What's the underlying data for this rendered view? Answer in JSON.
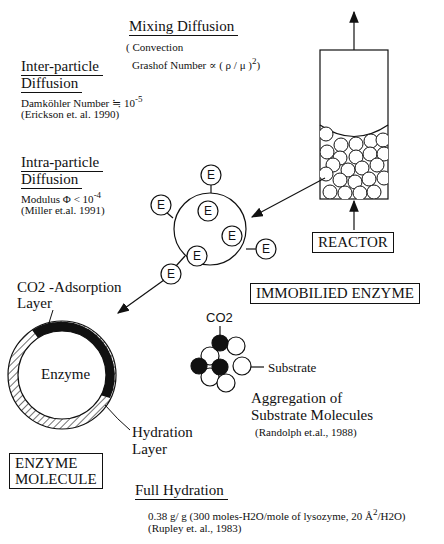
{
  "mixing": {
    "title": "Mixing Diffusion",
    "line1": "( Convection",
    "line2": "Grashof Number  ∝  ( ρ / μ )",
    "exponent": "2",
    "close": ")"
  },
  "inter_particle": {
    "title1": "Inter-particle",
    "title2": "Diffusion",
    "formula": "Damköhler Number  ≒ 10",
    "exponent": "-5",
    "reference": "(Erickson et. al. 1990)"
  },
  "intra_particle": {
    "title1": "Intra-particle",
    "title2": "Diffusion",
    "formula": "Modulus Φ < 10",
    "exponent": "-4",
    "reference": "(Miller et.al. 1991)"
  },
  "reactor": {
    "label": "REACTOR"
  },
  "immobilized": {
    "label": "IMMOBILIED ENZYME",
    "enzyme_glyph": "E"
  },
  "enzyme_molecule": {
    "label_line1": "ENZYME",
    "label_line2": "MOLECULE",
    "core_label": "Enzyme",
    "co2_layer_line1": "CO2 -Adsorption",
    "co2_layer_line2": "Layer",
    "hydration_line1": "Hydration",
    "hydration_line2": "Layer"
  },
  "substrate": {
    "co2_label": "CO2",
    "substrate_label": "Substrate",
    "aggregation_line1": "Aggregation of",
    "aggregation_line2": "Substrate Molecules",
    "reference": "(Randolph et.al., 1988)"
  },
  "full_hydration": {
    "title": "Full Hydration",
    "detail": "0.38 g/ g (300 moles-H2O/mole of lysozyme,  20 Å",
    "detail_exp": "2",
    "detail_end": "/H2O)",
    "reference": "(Rupley et. al., 1983)"
  }
}
